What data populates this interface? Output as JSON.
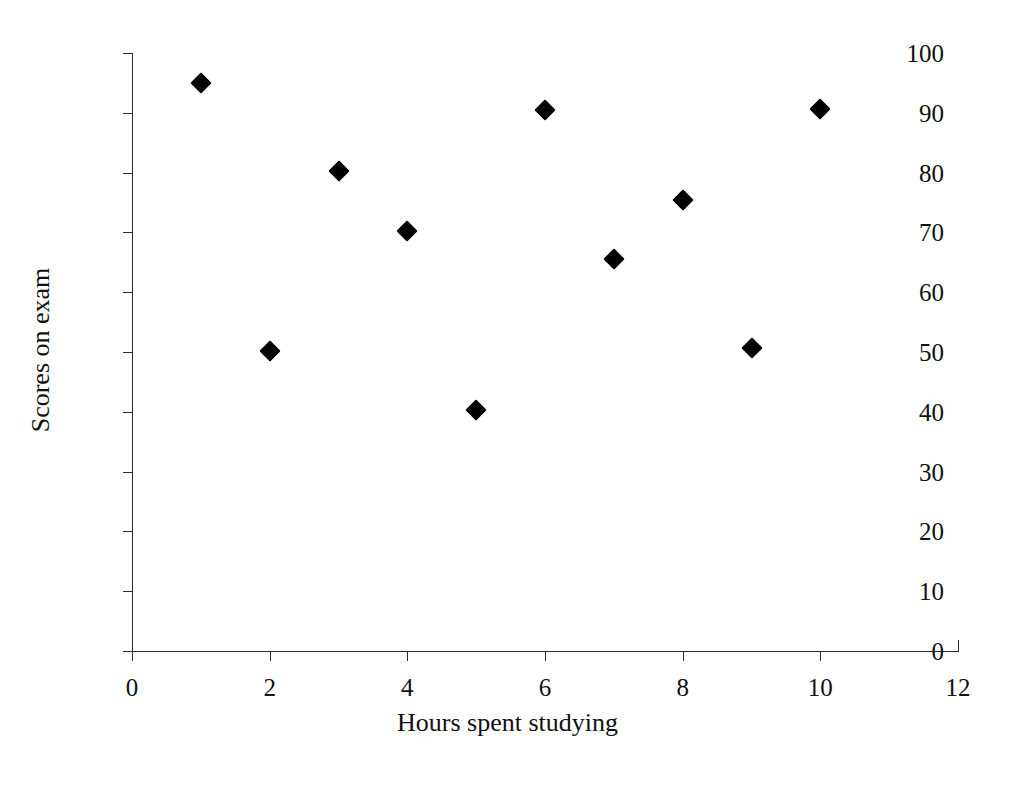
{
  "chart_data": {
    "type": "scatter",
    "title": "",
    "xlabel": "Hours spent studying",
    "ylabel": "Scores on exam",
    "xlim": [
      0,
      12
    ],
    "ylim": [
      0,
      100
    ],
    "grid": false,
    "legend": null,
    "marker": "black-diamond",
    "x_ticks": [
      0,
      2,
      4,
      6,
      8,
      10,
      12
    ],
    "y_ticks": [
      0,
      10,
      20,
      30,
      40,
      50,
      60,
      70,
      80,
      90,
      100
    ],
    "x_tick_labels": [
      "0",
      "2",
      "4",
      "6",
      "8",
      "10",
      "12"
    ],
    "y_tick_labels": [
      "0",
      "10",
      "20",
      "30",
      "40",
      "50",
      "60",
      "70",
      "80",
      "90",
      "100"
    ],
    "x": [
      1,
      2,
      3,
      4,
      5,
      6,
      7,
      8,
      9,
      10
    ],
    "y": [
      95.0,
      50.1,
      80.3,
      70.3,
      40.3,
      90.5,
      65.5,
      75.5,
      50.6,
      90.7
    ],
    "points": [
      {
        "x": 1,
        "y": 95.0
      },
      {
        "x": 2,
        "y": 50.1
      },
      {
        "x": 3,
        "y": 80.3
      },
      {
        "x": 4,
        "y": 70.3
      },
      {
        "x": 5,
        "y": 40.3
      },
      {
        "x": 6,
        "y": 90.5
      },
      {
        "x": 7,
        "y": 65.5
      },
      {
        "x": 8,
        "y": 75.5
      },
      {
        "x": 9,
        "y": 50.6
      },
      {
        "x": 10,
        "y": 90.7
      }
    ],
    "colors": {
      "marker": "#000000",
      "axis": "#2a2a2a",
      "text": "#111111",
      "background": "#ffffff"
    }
  }
}
